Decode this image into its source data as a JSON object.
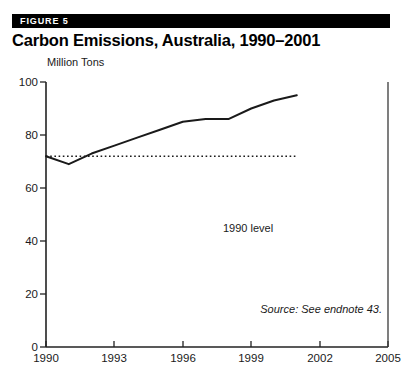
{
  "header": {
    "figure_label": "FIGURE 5",
    "title": "Carbon Emissions, Australia, 1990–2001",
    "banner_color": "#000000"
  },
  "annotations": {
    "baseline_label": "1990 level",
    "source_note": "Source: See endnote 43."
  },
  "chart_data": {
    "type": "line",
    "title": "Carbon Emissions, Australia, 1990–2001",
    "xlabel": "",
    "ylabel": "Million Tons",
    "unit_label": "Million Tons",
    "xlim": [
      1990,
      2005
    ],
    "ylim": [
      0,
      100
    ],
    "xticks": [
      1990,
      1993,
      1996,
      1999,
      2002,
      2005
    ],
    "xtick_labels": [
      "1990",
      "1993",
      "1996",
      "1999",
      "2002",
      "2005"
    ],
    "yticks": [
      0,
      20,
      40,
      60,
      80,
      100
    ],
    "ytick_labels": [
      "0",
      "20",
      "40",
      "60",
      "80",
      "100"
    ],
    "grid": false,
    "legend": "none",
    "line_color": "#1a1a1a",
    "series": [
      {
        "name": "Carbon emissions",
        "x": [
          1990,
          1991,
          1992,
          1993,
          1994,
          1995,
          1996,
          1997,
          1998,
          1999,
          2000,
          2001
        ],
        "values": [
          72,
          69,
          73,
          76,
          79,
          82,
          85,
          86,
          86,
          90,
          93,
          95
        ]
      }
    ],
    "reference_line": {
      "label": "1990 level",
      "value": 72,
      "style": "dotted",
      "x_start": 1990,
      "x_end": 2001
    }
  }
}
